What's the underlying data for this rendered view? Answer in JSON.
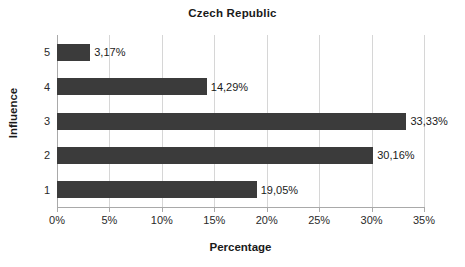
{
  "chart_data": {
    "type": "bar",
    "orientation": "horizontal",
    "title": "Czech Republic",
    "xlabel": "Percentage",
    "ylabel": "Influence",
    "categories": [
      "1",
      "2",
      "3",
      "4",
      "5"
    ],
    "values": [
      19.05,
      30.16,
      33.33,
      14.29,
      3.17
    ],
    "data_labels": [
      "19,05%",
      "30,16%",
      "33,33%",
      "14,29%",
      "3,17%"
    ],
    "xlim": [
      0,
      35
    ],
    "xticks": [
      0,
      5,
      10,
      15,
      20,
      25,
      30,
      35
    ],
    "xtick_labels": [
      "0%",
      "5%",
      "10%",
      "15%",
      "20%",
      "25%",
      "30%",
      "35%"
    ],
    "grid": "vertical",
    "legend": "none",
    "bar_color": "#3b3b3b",
    "gridline_color": "#d6d6d6",
    "axis_color": "#a9a9a9",
    "background_color": "#ffffff",
    "series": [
      {
        "name": "Percentage",
        "values": [
          19.05,
          30.16,
          33.33,
          14.29,
          3.17
        ]
      }
    ]
  }
}
